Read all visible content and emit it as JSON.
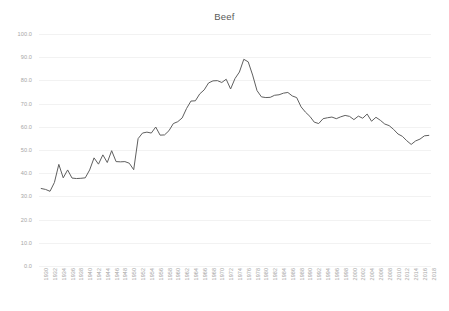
{
  "chart_data": {
    "type": "line",
    "title": "Beef",
    "xlabel": "",
    "ylabel": "",
    "ylim": [
      0,
      100
    ],
    "ytick_labels": [
      "100.0",
      "90.0",
      "80.0",
      "70.0",
      "60.0",
      "50.0",
      "40.0",
      "30.0",
      "20.0",
      "10.0",
      "0.0"
    ],
    "ytick_values": [
      100,
      90,
      80,
      70,
      60,
      50,
      40,
      30,
      20,
      10,
      0
    ],
    "grid": true,
    "legend": "none",
    "line_color": "#5f5f5f",
    "gridline_color": "#f2f2f2",
    "label_color": "#a6a6a6",
    "xtick_labels": [
      "1930",
      "1932",
      "1934",
      "1936",
      "1938",
      "1940",
      "1942",
      "1944",
      "1946",
      "1948",
      "1950",
      "1952",
      "1954",
      "1956",
      "1958",
      "1960",
      "1962",
      "1964",
      "1966",
      "1968",
      "1970",
      "1972",
      "1974",
      "1976",
      "1978",
      "1980",
      "1982",
      "1984",
      "1986",
      "1988",
      "1990",
      "1992",
      "1994",
      "1996",
      "1998",
      "2000",
      "2002",
      "2004",
      "2006",
      "2008",
      "2010",
      "2012",
      "2014",
      "2016",
      "2018"
    ],
    "x": [
      1930,
      1931,
      1932,
      1933,
      1934,
      1935,
      1936,
      1937,
      1938,
      1939,
      1940,
      1941,
      1942,
      1943,
      1944,
      1945,
      1946,
      1947,
      1948,
      1949,
      1950,
      1951,
      1952,
      1953,
      1954,
      1955,
      1956,
      1957,
      1958,
      1959,
      1960,
      1961,
      1962,
      1963,
      1964,
      1965,
      1966,
      1967,
      1968,
      1969,
      1970,
      1971,
      1972,
      1973,
      1974,
      1975,
      1976,
      1977,
      1978,
      1979,
      1980,
      1981,
      1982,
      1983,
      1984,
      1985,
      1986,
      1987,
      1988,
      1989,
      1990,
      1991,
      1992,
      1993,
      1994,
      1995,
      1996,
      1997,
      1998,
      1999,
      2000,
      2001,
      2002,
      2003,
      2004,
      2005,
      2006,
      2007,
      2008,
      2009,
      2010,
      2011,
      2012,
      2013,
      2014,
      2015,
      2016,
      2017,
      2018
    ],
    "values": [
      33.4,
      33.0,
      32.2,
      36.0,
      43.8,
      38.0,
      41.4,
      37.9,
      37.7,
      37.8,
      38.0,
      41.4,
      46.6,
      43.9,
      47.9,
      44.6,
      49.7,
      45.0,
      44.9,
      45.0,
      44.3,
      41.5,
      54.9,
      57.3,
      57.7,
      57.3,
      59.9,
      56.4,
      56.5,
      58.3,
      61.4,
      62.2,
      63.8,
      67.9,
      71.1,
      71.2,
      74.2,
      75.9,
      78.9,
      79.8,
      79.9,
      79.1,
      80.5,
      76.3,
      80.8,
      83.6,
      89.1,
      88.0,
      82.3,
      75.6,
      72.9,
      72.6,
      72.7,
      73.6,
      73.8,
      74.5,
      74.8,
      73.3,
      72.6,
      68.6,
      66.3,
      64.5,
      62.0,
      61.4,
      63.5,
      63.9,
      64.2,
      63.5,
      64.3,
      64.9,
      64.5,
      63.1,
      64.6,
      63.7,
      65.5,
      62.4,
      64.1,
      62.8,
      61.2,
      60.5,
      58.9,
      56.9,
      55.9,
      54.0,
      52.4,
      53.9,
      54.7,
      56.1,
      56.3
    ]
  }
}
